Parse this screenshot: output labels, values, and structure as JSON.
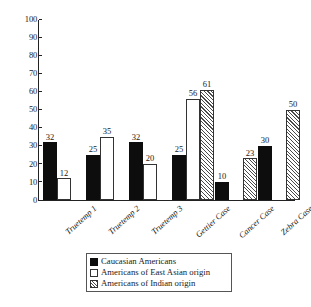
{
  "chart_data": {
    "type": "bar",
    "title": "",
    "subtitle": "",
    "xlabel": "",
    "ylabel": "",
    "ylim": [
      0,
      100
    ],
    "y_ticks": [
      0,
      10,
      20,
      30,
      40,
      50,
      60,
      70,
      80,
      90,
      100
    ],
    "grid": false,
    "legend_position": "bottom-center",
    "categories": [
      "Truetemp 1",
      "Truetemp 2",
      "Truetemp 3",
      "Gettier Case",
      "Cancer Case",
      "Zebra Case"
    ],
    "series": [
      {
        "name": "Caucasian Americans",
        "swatch": "solid-black",
        "color": "#0d0d0d",
        "values": [
          32,
          25,
          32,
          25,
          10,
          30
        ]
      },
      {
        "name": "Americans of East Asian origin",
        "swatch": "white-outline",
        "color": "#ffffff",
        "values": [
          12,
          35,
          20,
          56,
          null,
          null
        ]
      },
      {
        "name": "Americans of Indian origin",
        "swatch": "diagonal-hatch",
        "color": "#ffffff",
        "values": [
          null,
          null,
          null,
          61,
          23,
          50
        ]
      }
    ],
    "data_labels": [
      [
        "32",
        "12"
      ],
      [
        "25",
        "35"
      ],
      [
        "32",
        "20"
      ],
      [
        "25",
        "56",
        "61"
      ],
      [
        "10",
        "23"
      ],
      [
        "30",
        "50"
      ]
    ]
  },
  "axis": {
    "y_tick_labels": [
      "100",
      "90",
      "80",
      "70",
      "60",
      "50",
      "40",
      "30",
      "20",
      "10",
      "0"
    ]
  },
  "legend": {
    "items": [
      {
        "label": "Caucasian Americans"
      },
      {
        "label": "Americans of East Asian origin"
      },
      {
        "label": "Americans of Indian origin"
      }
    ]
  }
}
